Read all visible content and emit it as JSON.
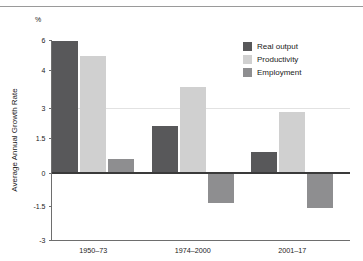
{
  "chart_data": {
    "type": "bar",
    "title": "",
    "subtitle": "",
    "xlabel": "",
    "ylabel": "Average Annual Growth Rate",
    "unit_label": "%",
    "categories": [
      "1950–73",
      "1974–2000",
      "2001–17"
    ],
    "series": [
      {
        "name": "Real output",
        "color": "#58585a",
        "values": [
          5.9,
          2.1,
          0.9
        ]
      },
      {
        "name": "Productivity",
        "color": "#d0d0d0",
        "values": [
          4.9,
          3.55,
          2.8
        ]
      },
      {
        "name": "Employment",
        "color": "#8e8e90",
        "values": [
          0.6,
          -1.35,
          -1.6
        ]
      }
    ],
    "ytick_labels": [
      "6",
      "4",
      "3",
      "1.5",
      "0",
      "-1.5",
      "-3"
    ],
    "ytick_values": [
      6,
      4,
      3,
      1.5,
      0,
      -1.5,
      -3
    ],
    "ylim": [
      -3,
      6
    ],
    "grid": true,
    "gridlines_at": [
      3
    ],
    "legend_position": "top-right",
    "axis_note": "non-linear y-axis: tick spacing is uneven between 6, 4, 3, 1.5, 0, -1.5, -3"
  },
  "legend": {
    "entries": [
      {
        "label": "Real output"
      },
      {
        "label": "Productivity"
      },
      {
        "label": "Employment"
      }
    ]
  },
  "colors": {
    "real_output": "#58585a",
    "productivity": "#d0d0d0",
    "employment": "#8e8e90",
    "axis": "#6e6e6e",
    "zero_line": "#3a3a3a",
    "grid": "#e2e2e2",
    "top_rule": "#9a9a9a",
    "text": "#1a1a1a"
  }
}
